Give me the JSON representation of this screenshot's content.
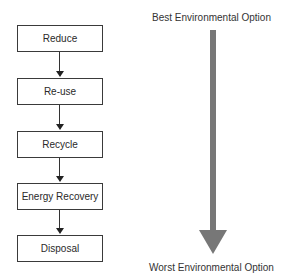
{
  "diagram": {
    "type": "waste-hierarchy-flowchart",
    "steps": [
      {
        "label": "Reduce"
      },
      {
        "label": "Re-use"
      },
      {
        "label": "Recycle"
      },
      {
        "label": "Energy Recovery"
      },
      {
        "label": "Disposal"
      }
    ],
    "scale": {
      "top_label": "Best Environmental Option",
      "bottom_label": "Worst Environmental Option",
      "arrow_color": "#777777"
    }
  }
}
